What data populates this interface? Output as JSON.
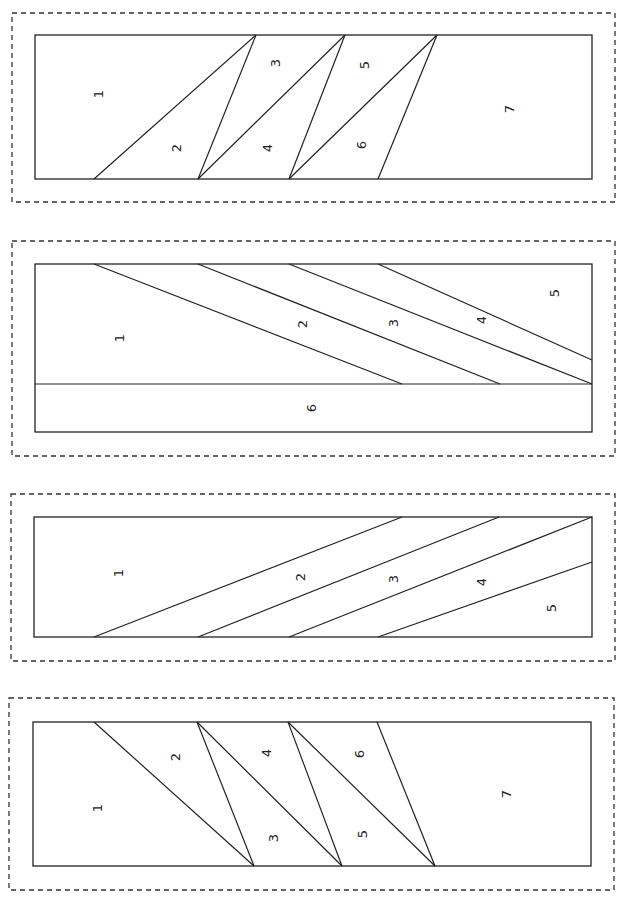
{
  "page": {
    "width": 625,
    "height": 901
  },
  "colors": {
    "line": "#222222",
    "dashed": "#333333",
    "background": "#ffffff"
  },
  "panels": [
    {
      "name": "panel-1",
      "outer": [
        12,
        13,
        615,
        202
      ],
      "inner": [
        35,
        35,
        592,
        179
      ],
      "seams": [
        [
          [
            94,
            179
          ],
          [
            256,
            35
          ]
        ],
        [
          [
            198,
            179
          ],
          [
            256,
            35
          ]
        ],
        [
          [
            198,
            179
          ],
          [
            345,
            35
          ]
        ],
        [
          [
            289,
            179
          ],
          [
            345,
            35
          ]
        ],
        [
          [
            289,
            179
          ],
          [
            437,
            35
          ]
        ],
        [
          [
            378,
            179
          ],
          [
            437,
            35
          ]
        ]
      ],
      "labels": [
        {
          "text": "1",
          "x": 98,
          "y": 94
        },
        {
          "text": "2",
          "x": 176,
          "y": 148
        },
        {
          "text": "3",
          "x": 275,
          "y": 63
        },
        {
          "text": "4",
          "x": 267,
          "y": 148
        },
        {
          "text": "5",
          "x": 364,
          "y": 65
        },
        {
          "text": "6",
          "x": 361,
          "y": 145
        },
        {
          "text": "7",
          "x": 509,
          "y": 109
        }
      ]
    },
    {
      "name": "panel-2",
      "outer": [
        12,
        241,
        615,
        456
      ],
      "inner": [
        35,
        264,
        592,
        432
      ],
      "seams": [
        [
          [
            35,
            384
          ],
          [
            592,
            384
          ]
        ],
        [
          [
            94,
            264
          ],
          [
            402,
            384
          ]
        ],
        [
          [
            198,
            264
          ],
          [
            500,
            384
          ]
        ],
        [
          [
            289,
            264
          ],
          [
            592,
            384
          ]
        ],
        [
          [
            378,
            264
          ],
          [
            592,
            360
          ]
        ]
      ],
      "labels": [
        {
          "text": "1",
          "x": 119,
          "y": 338
        },
        {
          "text": "2",
          "x": 302,
          "y": 324
        },
        {
          "text": "3",
          "x": 393,
          "y": 323
        },
        {
          "text": "4",
          "x": 481,
          "y": 320
        },
        {
          "text": "5",
          "x": 554,
          "y": 293
        },
        {
          "text": "6",
          "x": 311,
          "y": 408
        }
      ]
    },
    {
      "name": "panel-3",
      "outer": [
        11,
        494,
        615,
        661
      ],
      "inner": [
        34,
        517,
        592,
        637
      ],
      "seams": [
        [
          [
            94,
            637
          ],
          [
            402,
            517
          ]
        ],
        [
          [
            198,
            637
          ],
          [
            499,
            517
          ]
        ],
        [
          [
            289,
            637
          ],
          [
            592,
            517
          ]
        ],
        [
          [
            378,
            637
          ],
          [
            592,
            562
          ]
        ]
      ],
      "labels": [
        {
          "text": "1",
          "x": 118,
          "y": 573
        },
        {
          "text": "2",
          "x": 300,
          "y": 577
        },
        {
          "text": "3",
          "x": 393,
          "y": 579
        },
        {
          "text": "4",
          "x": 481,
          "y": 582
        },
        {
          "text": "5",
          "x": 551,
          "y": 608
        }
      ]
    },
    {
      "name": "panel-4",
      "outer": [
        9,
        698,
        614,
        890
      ],
      "inner": [
        33,
        722,
        591,
        866
      ],
      "seams": [
        [
          [
            94,
            722
          ],
          [
            254,
            866
          ]
        ],
        [
          [
            197,
            722
          ],
          [
            254,
            866
          ]
        ],
        [
          [
            197,
            722
          ],
          [
            342,
            866
          ]
        ],
        [
          [
            288,
            722
          ],
          [
            342,
            866
          ]
        ],
        [
          [
            288,
            722
          ],
          [
            435,
            866
          ]
        ],
        [
          [
            377,
            722
          ],
          [
            435,
            866
          ]
        ]
      ],
      "labels": [
        {
          "text": "1",
          "x": 97,
          "y": 808
        },
        {
          "text": "2",
          "x": 175,
          "y": 757
        },
        {
          "text": "3",
          "x": 273,
          "y": 838
        },
        {
          "text": "4",
          "x": 266,
          "y": 753
        },
        {
          "text": "5",
          "x": 362,
          "y": 834
        },
        {
          "text": "6",
          "x": 359,
          "y": 754
        },
        {
          "text": "7",
          "x": 506,
          "y": 794
        }
      ]
    }
  ]
}
